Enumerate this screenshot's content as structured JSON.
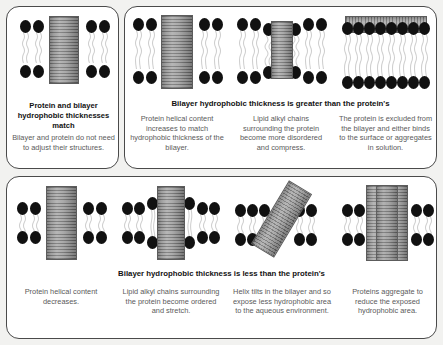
{
  "figure": {
    "background_color": "#f2f2f0",
    "panel_color": "#ffffff",
    "panel_border_color": "#4a4a4a",
    "lipid_head_color": "#111111",
    "lipid_tail_color": "#cfcfcf",
    "protein_color": "#9a9a9a"
  },
  "groups": [
    {
      "id": "match",
      "header": "",
      "panels": [
        {
          "id": "match",
          "bold_caption": "Protein and bilayer hydrophobic thicknesses match",
          "caption": "Bilayer and protein do not need to adjust their structures.",
          "icon": "protein-in-matched-bilayer"
        }
      ]
    },
    {
      "id": "greater",
      "header": "Bilayer hydrophobic thickness is greater than the protein's",
      "panels": [
        {
          "id": "helical-content-increases",
          "bold_caption": "",
          "caption": "Protein helical content increases to match hydrophobic thickness of the bilayer.",
          "icon": "protein-stretched-in-thick-bilayer"
        },
        {
          "id": "lipids-disorder-compress",
          "bold_caption": "",
          "caption": "Lipid alkyl chains surrounding the protein become more disordered and compress.",
          "icon": "lipids-compressed-around-protein"
        },
        {
          "id": "protein-excluded",
          "bold_caption": "",
          "caption": "The protein is excluded from the bilayer and either binds to the surface or aggregates in solution.",
          "icon": "protein-excluded-on-surface"
        }
      ]
    },
    {
      "id": "less",
      "header": "Bilayer hydrophobic thickness is less than the protein's",
      "panels": [
        {
          "id": "helical-content-decreases",
          "bold_caption": "",
          "caption": "Protein helical content decreases.",
          "icon": "protein-shortened-in-thin-bilayer"
        },
        {
          "id": "lipids-order-stretch",
          "bold_caption": "",
          "caption": "Lipid alkyl chains surrounding the protein become ordered and stretch.",
          "icon": "lipids-stretched-around-protein"
        },
        {
          "id": "helix-tilts",
          "bold_caption": "",
          "caption": "Helix tilts in the bilayer and so expose less hydrophobic area to the aqueous environment.",
          "icon": "tilted-protein-helix"
        },
        {
          "id": "proteins-aggregate",
          "bold_caption": "",
          "caption": "Proteins aggregate to reduce the exposed hydrophobic area.",
          "icon": "aggregated-proteins"
        }
      ]
    }
  ]
}
